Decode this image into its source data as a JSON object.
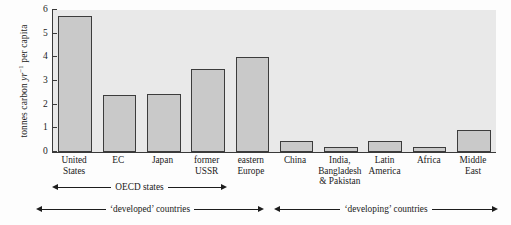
{
  "chart_data": {
    "type": "bar",
    "title": "",
    "xlabel": "",
    "ylabel": "tonnes carbon yr-1 per capita",
    "ylabel_parts": {
      "prefix": "tonnes carbon ",
      "italic": "yr",
      "superscript": "−1",
      "suffix": " per capita"
    },
    "ylim": [
      0,
      6
    ],
    "yticks": [
      0,
      1,
      2,
      3,
      4,
      5,
      6
    ],
    "ytick_labels": [
      "0",
      "1",
      "2",
      "3",
      "4",
      "5",
      "6"
    ],
    "grid": false,
    "legend": "none",
    "categories": [
      "United States",
      "EC",
      "Japan",
      "former USSR",
      "eastern Europe",
      "China",
      "India, Bangladesh & Pakistan",
      "Latin America",
      "Africa",
      "Middle East"
    ],
    "category_lines": [
      [
        "United",
        "States"
      ],
      [
        "EC"
      ],
      [
        "Japan"
      ],
      [
        "former",
        "USSR"
      ],
      [
        "eastern",
        "Europe"
      ],
      [
        "China"
      ],
      [
        "India,",
        "Bangladesh",
        "& Pakistan"
      ],
      [
        "Latin",
        "America"
      ],
      [
        "Africa"
      ],
      [
        "Middle",
        "East"
      ]
    ],
    "values": [
      5.75,
      2.4,
      2.45,
      3.5,
      4.0,
      0.45,
      0.2,
      0.45,
      0.2,
      0.95
    ],
    "bar_color": "#c9c9c9",
    "bar_edge_color": "#3c3c3c",
    "plot_background": "#e9e9e9",
    "axis_color": "#3a3a3a"
  },
  "annotations": {
    "oecd": "OECD states",
    "developed": "‘developed’ countries",
    "developing": "‘developing’ countries"
  }
}
